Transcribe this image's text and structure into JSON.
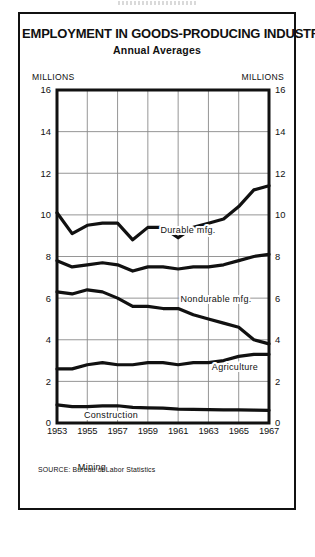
{
  "figure": {
    "title": "EMPLOYMENT IN GOODS-PRODUCING INDUSTRIES",
    "subtitle": "Annual Averages",
    "unit_label_left": "MILLIONS",
    "unit_label_right": "MILLIONS",
    "source": "SOURCE: Bureau of Labor Statistics"
  },
  "chart_data": {
    "type": "line",
    "title": "EMPLOYMENT IN GOODS-PRODUCING INDUSTRIES",
    "subtitle": "Annual Averages",
    "xlabel": "",
    "ylabel": "MILLIONS",
    "ylim": [
      0,
      16
    ],
    "xlim": [
      1953,
      1967
    ],
    "yticks": [
      0,
      2,
      4,
      6,
      8,
      10,
      12,
      14,
      16
    ],
    "ytick_labels": [
      "0",
      "2",
      "4",
      "6",
      "8",
      "10",
      "12",
      "14",
      "16"
    ],
    "xticks": [
      1953,
      1955,
      1957,
      1959,
      1961,
      1963,
      1965,
      1967
    ],
    "xtick_labels": [
      "1953",
      "1955",
      "1957",
      "1959",
      "1961",
      "1963",
      "1965",
      "1967"
    ],
    "grid": true,
    "grid_axes": "both",
    "dual_y_axis": true,
    "legend": "inline-annotations",
    "x": [
      1953,
      1954,
      1955,
      1956,
      1957,
      1958,
      1959,
      1960,
      1961,
      1962,
      1963,
      1964,
      1965,
      1966,
      1967
    ],
    "series": [
      {
        "name": "Durable mfg.",
        "label": "Durable mfg.",
        "values": [
          10.1,
          9.1,
          9.5,
          9.6,
          9.6,
          8.8,
          9.4,
          9.4,
          8.9,
          9.4,
          9.6,
          9.8,
          10.4,
          11.2,
          11.4
        ]
      },
      {
        "name": "Nondurable mfg.",
        "label": "Nondurable mfg.",
        "values": [
          7.8,
          7.5,
          7.6,
          7.7,
          7.6,
          7.3,
          7.5,
          7.5,
          7.4,
          7.5,
          7.5,
          7.6,
          7.8,
          8.0,
          8.1
        ]
      },
      {
        "name": "Agriculture",
        "label": "Agriculture",
        "values": [
          6.3,
          6.2,
          6.4,
          6.3,
          6.0,
          5.6,
          5.6,
          5.5,
          5.5,
          5.2,
          5.0,
          4.8,
          4.6,
          4.0,
          3.8
        ]
      },
      {
        "name": "Construction",
        "label": "Construction",
        "values": [
          2.6,
          2.6,
          2.8,
          2.9,
          2.8,
          2.8,
          2.9,
          2.9,
          2.8,
          2.9,
          2.9,
          3.0,
          3.2,
          3.3,
          3.3
        ]
      },
      {
        "name": "Mining",
        "label": "Mining",
        "values": [
          0.87,
          0.79,
          0.79,
          0.82,
          0.83,
          0.75,
          0.73,
          0.71,
          0.67,
          0.65,
          0.64,
          0.63,
          0.63,
          0.62,
          0.61
        ]
      }
    ]
  }
}
